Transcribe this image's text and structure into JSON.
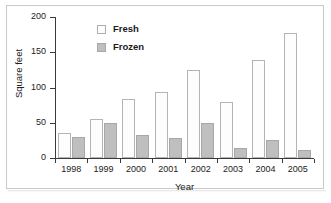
{
  "chart_data": {
    "type": "bar",
    "title": "",
    "xlabel": "Year",
    "ylabel": "Square feet",
    "categories": [
      "1998",
      "1999",
      "2000",
      "2001",
      "2002",
      "2003",
      "2004",
      "2005"
    ],
    "series": [
      {
        "name": "Fresh",
        "values": [
          35,
          55,
          84,
          94,
          125,
          80,
          139,
          177
        ],
        "color": "#fdfdfd",
        "edge_color": "#b4b4b4"
      },
      {
        "name": "Frozen",
        "values": [
          30,
          49,
          32,
          29,
          50,
          14,
          26,
          11
        ],
        "color": "#bfbfbf",
        "edge_color": "#a8a8a8"
      }
    ],
    "ylim": [
      0,
      200
    ],
    "yticks": [
      0,
      50,
      100,
      150,
      200
    ],
    "ytick_labels": [
      "0",
      "50",
      "100",
      "150",
      "200"
    ],
    "grid": false,
    "legend_position": "upper-left-inside"
  },
  "legend": {
    "entries": [
      {
        "label": "Fresh",
        "swatch": "open-square-swatch"
      },
      {
        "label": "Frozen",
        "swatch": "filled-square-swatch"
      }
    ]
  },
  "axes": {
    "y_label": "Square feet",
    "x_label": "Year"
  }
}
